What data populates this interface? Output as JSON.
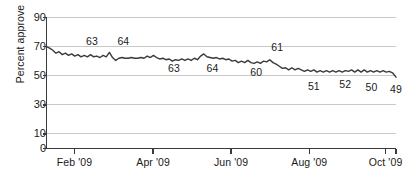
{
  "chart_data": {
    "type": "line",
    "title": "",
    "subtitle": "",
    "xlabel": "",
    "ylabel": "Percent approve",
    "ylim": [
      0,
      90
    ],
    "xlim": [
      0,
      100
    ],
    "grid": true,
    "grid_axis": "y",
    "legend": "none",
    "line_color": "#3a3a3a",
    "grid_color": "#c9c9c9",
    "axis_color": "#3a3a3a",
    "yticks": [
      90,
      70,
      50,
      30,
      10,
      0
    ],
    "ytick_labels": [
      "90",
      "70",
      "50",
      "30",
      "10",
      "0"
    ],
    "xticks": [
      8.0,
      30.5,
      52.8,
      75.2,
      97.0
    ],
    "xtick_labels": [
      "Feb '09",
      "Apr '09",
      "Jun '09",
      "Aug '09",
      "Oct '09"
    ],
    "annotations": [
      {
        "label": "63",
        "x": 13.0,
        "y": 74.0,
        "position": "above"
      },
      {
        "label": "64",
        "x": 22.0,
        "y": 74.0,
        "position": "above"
      },
      {
        "label": "63",
        "x": 36.5,
        "y": 55.0,
        "position": "below"
      },
      {
        "label": "64",
        "x": 47.5,
        "y": 55.0,
        "position": "below"
      },
      {
        "label": "61",
        "x": 66.0,
        "y": 70.0,
        "position": "above"
      },
      {
        "label": "60",
        "x": 60.0,
        "y": 52.5,
        "position": "below"
      },
      {
        "label": "51",
        "x": 76.5,
        "y": 43.0,
        "position": "below"
      },
      {
        "label": "52",
        "x": 85.5,
        "y": 44.0,
        "position": "below"
      },
      {
        "label": "50",
        "x": 93.0,
        "y": 42.0,
        "position": "below"
      },
      {
        "label": "49",
        "x": 100.0,
        "y": 41.0,
        "position": "below"
      }
    ],
    "series": [
      {
        "name": "Percent approve",
        "x": [
          0.0,
          0.9,
          1.8,
          2.7,
          3.6,
          4.5,
          5.4,
          6.3,
          7.2,
          8.1,
          9.0,
          9.9,
          10.8,
          11.7,
          12.6,
          13.5,
          14.4,
          15.3,
          16.2,
          17.1,
          18.0,
          18.9,
          19.8,
          20.7,
          21.6,
          22.5,
          23.4,
          24.3,
          25.2,
          26.1,
          27.0,
          27.9,
          28.8,
          29.7,
          30.6,
          31.5,
          32.4,
          33.3,
          34.2,
          35.1,
          36.0,
          36.9,
          37.8,
          38.7,
          39.6,
          40.5,
          41.4,
          42.3,
          43.2,
          44.1,
          45.0,
          45.9,
          46.8,
          47.7,
          48.6,
          49.5,
          50.4,
          51.3,
          52.2,
          53.1,
          54.0,
          54.9,
          55.8,
          56.7,
          57.6,
          58.5,
          59.4,
          60.3,
          61.2,
          62.1,
          63.0,
          63.9,
          64.8,
          65.7,
          66.6,
          67.5,
          68.4,
          69.3,
          70.2,
          71.1,
          72.0,
          72.9,
          73.8,
          74.7,
          75.6,
          76.5,
          77.4,
          78.3,
          79.2,
          80.1,
          81.0,
          81.9,
          82.8,
          83.7,
          84.6,
          85.5,
          86.4,
          87.3,
          88.2,
          89.1,
          90.0,
          90.9,
          91.8,
          92.7,
          93.6,
          94.5,
          95.4,
          96.3,
          97.2,
          98.1,
          99.0,
          100.0
        ],
        "values": [
          70.0,
          69.0,
          67.5,
          65.5,
          66.5,
          64.5,
          65.5,
          64.0,
          65.0,
          63.5,
          64.5,
          63.0,
          64.0,
          63.0,
          64.5,
          63.0,
          63.5,
          62.5,
          64.0,
          63.0,
          66.0,
          62.5,
          60.5,
          62.0,
          62.5,
          62.0,
          62.0,
          62.5,
          62.0,
          62.0,
          62.5,
          62.0,
          63.5,
          62.5,
          64.0,
          62.5,
          61.5,
          62.0,
          61.0,
          61.5,
          60.0,
          61.0,
          60.5,
          61.5,
          60.5,
          61.5,
          60.5,
          62.0,
          61.0,
          63.5,
          65.0,
          63.0,
          62.5,
          62.0,
          62.5,
          61.5,
          62.0,
          61.0,
          61.5,
          60.0,
          60.5,
          59.0,
          60.0,
          59.0,
          60.5,
          59.0,
          58.5,
          59.5,
          58.5,
          60.0,
          59.5,
          61.0,
          59.0,
          58.0,
          56.5,
          55.0,
          55.5,
          54.0,
          55.5,
          54.0,
          55.0,
          54.0,
          53.0,
          54.0,
          53.0,
          54.0,
          52.5,
          53.5,
          52.5,
          53.5,
          52.5,
          53.5,
          52.5,
          53.5,
          52.5,
          53.5,
          53.0,
          54.0,
          52.5,
          54.0,
          52.5,
          54.0,
          52.5,
          53.5,
          52.5,
          53.5,
          52.5,
          53.5,
          52.5,
          53.0,
          52.0,
          49.0
        ]
      }
    ]
  },
  "footnote": {
    "text": ""
  }
}
